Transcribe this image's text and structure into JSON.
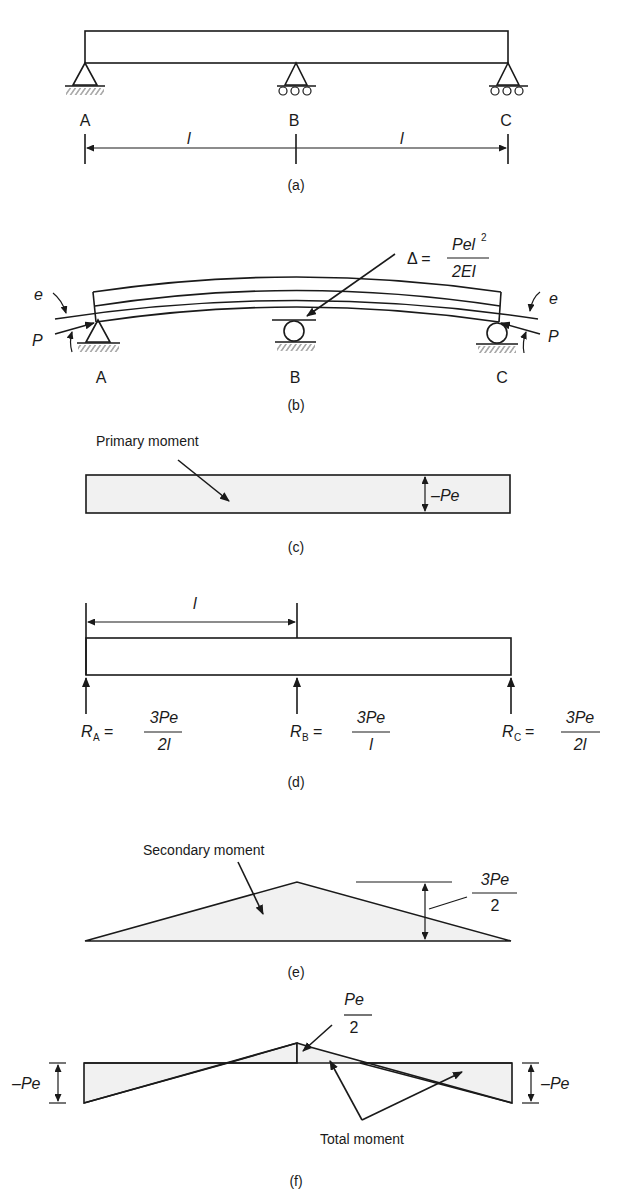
{
  "panels": {
    "a": {
      "caption": "(a)",
      "supports": [
        "A",
        "B",
        "C"
      ],
      "span_left": "l",
      "span_right": "l"
    },
    "b": {
      "caption": "(b)",
      "supports": [
        "A",
        "B",
        "C"
      ],
      "eccentricity_left": "e",
      "eccentricity_right": "e",
      "force_left": "P",
      "force_right": "P",
      "deflection": {
        "symbol": "Δ =",
        "numerator": "Pel",
        "numerator_exp": "2",
        "denominator": "2EI"
      }
    },
    "c": {
      "caption": "(c)",
      "label": "Primary moment",
      "value": "–Pe"
    },
    "d": {
      "caption": "(d)",
      "span": "l",
      "reactions": [
        {
          "name": "R",
          "sub": "A",
          "eq": "=",
          "numerator": "3Pe",
          "denominator": "2l"
        },
        {
          "name": "R",
          "sub": "B",
          "eq": "=",
          "numerator": "3Pe",
          "denominator": "l"
        },
        {
          "name": "R",
          "sub": "C",
          "eq": "=",
          "numerator": "3Pe",
          "denominator": "2l"
        }
      ]
    },
    "e": {
      "caption": "(e)",
      "label": "Secondary moment",
      "value_numerator": "3Pe",
      "value_denominator": "2"
    },
    "f": {
      "caption": "(f)",
      "label": "Total moment",
      "left_value": "–Pe",
      "right_value": "–Pe",
      "mid_numerator": "Pe",
      "mid_denominator": "2"
    }
  }
}
